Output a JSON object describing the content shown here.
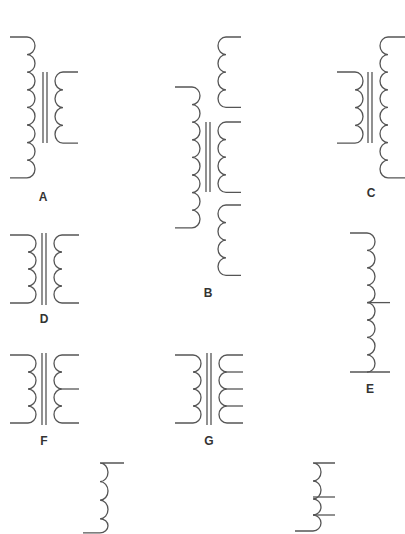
{
  "diagram": {
    "stroke_color": "#555555",
    "label_color": "#333333",
    "symbols": [
      {
        "id": "A",
        "label": "A",
        "description": "Iron-core transformer, 8-turn primary, 4-turn secondary (step-down)"
      },
      {
        "id": "B",
        "label": "B",
        "description": "Iron-core transformer, single primary, three separate secondaries"
      },
      {
        "id": "C",
        "label": "C",
        "description": "Iron-core transformer, 4-turn primary, 8-turn secondary (step-up)"
      },
      {
        "id": "D",
        "label": "D",
        "description": "Iron-core transformer, 1:1 turns ratio"
      },
      {
        "id": "E",
        "label": "E",
        "description": "Center-tapped inductor / autotransformer"
      },
      {
        "id": "F",
        "label": "F",
        "description": "Iron-core transformer with center-tapped secondary"
      },
      {
        "id": "G",
        "label": "G",
        "description": "Iron-core transformer with multi-tapped secondary"
      },
      {
        "id": "H",
        "label": "",
        "description": "Air-core inductor coil (unlabeled)"
      },
      {
        "id": "I",
        "label": "",
        "description": "Tapped air-core inductor (unlabeled)"
      }
    ]
  }
}
